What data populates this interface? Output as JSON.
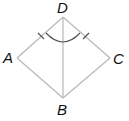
{
  "diagram": {
    "type": "geometry-kite",
    "points": {
      "A": {
        "label": "A",
        "x": 17,
        "y": 58
      },
      "B": {
        "label": "B",
        "x": 63,
        "y": 98
      },
      "C": {
        "label": "C",
        "x": 110,
        "y": 58
      },
      "D": {
        "label": "D",
        "x": 63,
        "y": 17
      }
    },
    "segments": [
      "DA",
      "DC",
      "AB",
      "CB",
      "DB"
    ],
    "congruence_marks": [
      "DA",
      "DC"
    ],
    "angle_mark": {
      "vertex": "D",
      "between": [
        "A",
        "C"
      ]
    },
    "colors": {
      "line": "#b8b8b8",
      "mark": "#555555",
      "label": "#111111"
    }
  }
}
